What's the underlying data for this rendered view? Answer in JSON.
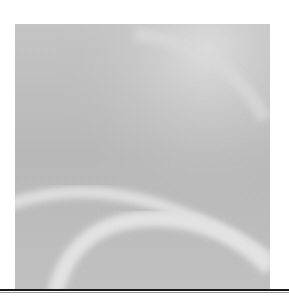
{
  "figure": {
    "colors": {
      "base": "#bdbdbd",
      "highlight": "#e0e0e0",
      "shadow": "#a9a9a9",
      "rule": "#1a1a1a"
    }
  }
}
